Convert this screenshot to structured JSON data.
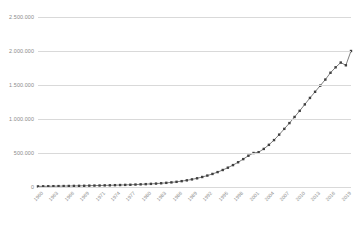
{
  "chart_data": {
    "type": "line",
    "title": "",
    "subtitle": "",
    "xlabel": "",
    "ylabel": "",
    "grid": true,
    "legend": false,
    "marker": "square",
    "line_color": "#7f7f7f",
    "marker_color": "#404040",
    "grid_color": "#d9d9d9",
    "label_color": "#8a8a8a",
    "ylim": [
      0,
      2500000
    ],
    "yticks": [
      0,
      500000,
      1000000,
      1500000,
      2000000,
      2500000
    ],
    "ytick_labels": [
      "0",
      "500.000",
      "1.000.000",
      "1.500.000",
      "2.000.000",
      "2.500.000"
    ],
    "xtick_step": 3,
    "xtick_labels": [
      "1960",
      "1963",
      "1966",
      "1969",
      "1971",
      "1974",
      "1977",
      "1980",
      "1983",
      "1986",
      "1989",
      "1992",
      "1995",
      "1998",
      "2001",
      "2004",
      "2007",
      "2010",
      "2013",
      "2016",
      "2019"
    ],
    "categories": [
      "1960",
      "1961",
      "1962",
      "1963",
      "1964",
      "1965",
      "1966",
      "1967",
      "1968",
      "1969",
      "1970",
      "1971",
      "1972",
      "1973",
      "1974",
      "1975",
      "1976",
      "1977",
      "1978",
      "1979",
      "1980",
      "1981",
      "1982",
      "1983",
      "1984",
      "1985",
      "1986",
      "1987",
      "1988",
      "1989",
      "1990",
      "1991",
      "1992",
      "1993",
      "1994",
      "1995",
      "1996",
      "1997",
      "1998",
      "1999",
      "2000",
      "2001",
      "2002",
      "2003",
      "2004",
      "2005",
      "2006",
      "2007",
      "2008",
      "2009",
      "2010",
      "2011",
      "2012",
      "2013",
      "2014",
      "2015",
      "2016",
      "2017",
      "2018",
      "2019",
      "2020",
      "2021"
    ],
    "values": [
      9000,
      10000,
      11000,
      12000,
      13000,
      14000,
      15000,
      16000,
      17000,
      18000,
      20000,
      21000,
      22000,
      24000,
      25000,
      27000,
      29000,
      31000,
      33000,
      36000,
      39000,
      42000,
      46000,
      50000,
      55000,
      61000,
      68000,
      76000,
      86000,
      98000,
      112000,
      128000,
      147000,
      168000,
      192000,
      219000,
      250000,
      284000,
      322000,
      364000,
      410000,
      460000,
      500000,
      512000,
      560000,
      620000,
      690000,
      770000,
      855000,
      940000,
      1030000,
      1120000,
      1215000,
      1310000,
      1400000,
      1490000,
      1580000,
      1680000,
      1760000,
      1830000,
      1790000,
      2000000
    ]
  }
}
